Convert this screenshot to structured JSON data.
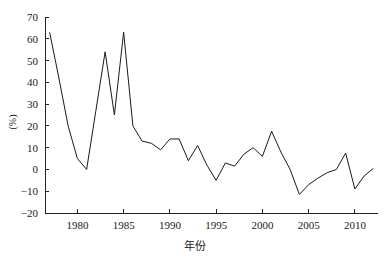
{
  "chart_data": {
    "type": "line",
    "title": "",
    "xlabel": "年份",
    "ylabel": "(%)",
    "xlim": [
      1976.5,
      2012.5
    ],
    "ylim": [
      -20,
      70
    ],
    "grid": false,
    "legend": null,
    "y_ticks": [
      70,
      60,
      50,
      40,
      30,
      20,
      10,
      0,
      -10,
      -20
    ],
    "y_tick_labels": [
      "70",
      "60",
      "50",
      "40",
      "30",
      "20",
      "10",
      "0",
      "−10",
      "−20"
    ],
    "x_ticks": [
      1980,
      1985,
      1990,
      1995,
      2000,
      2005,
      2010
    ],
    "x_tick_labels": [
      "1980",
      "1985",
      "1990",
      "1995",
      "2000",
      "2005",
      "2010"
    ],
    "series": [
      {
        "name": "",
        "color": "#1a1a1a",
        "x": [
          1977,
          1978,
          1979,
          1980,
          1981,
          1982,
          1983,
          1984,
          1985,
          1986,
          1987,
          1988,
          1989,
          1990,
          1991,
          1992,
          1993,
          1994,
          1995,
          1996,
          1997,
          1998,
          1999,
          2000,
          2001,
          2002,
          2003,
          2004,
          2005,
          2006,
          2007,
          2008,
          2009,
          2010,
          2011,
          2012
        ],
        "values": [
          63,
          42,
          20,
          5,
          0,
          27,
          54,
          25,
          63,
          20,
          13,
          12,
          9,
          14,
          14,
          4,
          11,
          2,
          -5,
          3,
          1.5,
          7,
          10,
          6,
          17.5,
          8,
          0,
          -11.5,
          -7,
          -4,
          -1.5,
          0,
          7.5,
          -9,
          -3,
          0.5
        ]
      }
    ]
  },
  "axis": {
    "y_label_text": "(%)",
    "x_label_text": "年份"
  }
}
